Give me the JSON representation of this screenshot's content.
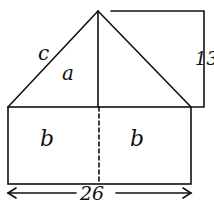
{
  "diagram": {
    "labels": {
      "hypotenuse": "c",
      "triangle_region": "a",
      "left_rect": "b",
      "right_rect": "b",
      "height": "13",
      "width": "26"
    },
    "colors": {
      "stroke": "#111111",
      "background": "#ffffff"
    }
  }
}
